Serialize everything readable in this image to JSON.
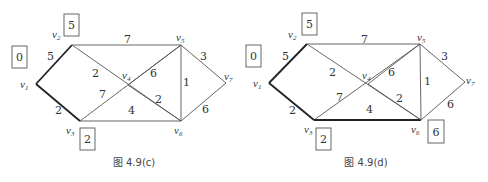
{
  "figures": [
    {
      "caption": "图 4.9(c)",
      "nodes": [
        {
          "id": "v1",
          "name": "v",
          "sub": "1",
          "x": 36,
          "y": 84,
          "lx": 20,
          "ly": 88
        },
        {
          "id": "v2",
          "name": "v",
          "sub": "2",
          "x": 72,
          "y": 45,
          "lx": 52,
          "ly": 38
        },
        {
          "id": "v3",
          "name": "v",
          "sub": "3",
          "x": 80,
          "y": 121,
          "lx": 66,
          "ly": 134
        },
        {
          "id": "v4",
          "name": "v",
          "sub": "4",
          "x": 128,
          "y": 85,
          "lx": 122,
          "ly": 79
        },
        {
          "id": "v5",
          "name": "v",
          "sub": "5",
          "x": 181,
          "y": 45,
          "lx": 176,
          "ly": 41
        },
        {
          "id": "v6",
          "name": "v",
          "sub": "6",
          "x": 181,
          "y": 121,
          "lx": 174,
          "ly": 134
        },
        {
          "id": "v7",
          "name": "v",
          "sub": "7",
          "x": 226,
          "y": 83,
          "lx": 224,
          "ly": 80
        }
      ],
      "edges": [
        {
          "from": "v1",
          "to": "v2",
          "w": "5",
          "lx": 47,
          "ly": 60,
          "bold": true
        },
        {
          "from": "v1",
          "to": "v3",
          "w": "2",
          "lx": 55,
          "ly": 114,
          "bold": true
        },
        {
          "from": "v2",
          "to": "v5",
          "w": "7",
          "lx": 124,
          "ly": 43,
          "bold": false
        },
        {
          "from": "v2",
          "to": "v6",
          "w": "2",
          "lx": 92,
          "ly": 77,
          "bold": false
        },
        {
          "from": "v3",
          "to": "v5",
          "w": "7",
          "lx": 99,
          "ly": 98,
          "bold": false
        },
        {
          "from": "v3",
          "to": "v6",
          "w": "4",
          "lx": 128,
          "ly": 114,
          "bold": false
        },
        {
          "from": "v5",
          "to": "v6",
          "w": "1",
          "lx": 183,
          "ly": 86,
          "bold": false
        },
        {
          "from": "v5",
          "to": "v7",
          "w": "3",
          "lx": 200,
          "ly": 60,
          "bold": false
        },
        {
          "from": "v6",
          "to": "v7",
          "w": "6",
          "lx": 202,
          "ly": 113,
          "bold": false
        },
        {
          "from": "v4",
          "to": "v5",
          "w": "6",
          "lx": 150,
          "ly": 77,
          "bold": false
        },
        {
          "from": "v4",
          "to": "v6",
          "w": "2",
          "lx": 155,
          "ly": 103,
          "bold": false
        }
      ],
      "boxes": [
        {
          "value": "0",
          "x": 12,
          "y": 46,
          "w": 15,
          "h": 22
        },
        {
          "value": "5",
          "x": 64,
          "y": 14,
          "w": 15,
          "h": 22
        },
        {
          "value": "2",
          "x": 80,
          "y": 128,
          "w": 15,
          "h": 22
        }
      ],
      "caption_x": 134,
      "caption_y": 166
    },
    {
      "caption": "图 4.9(d)",
      "nodes": [
        {
          "id": "v1",
          "name": "v",
          "sub": "1",
          "x": 269,
          "y": 83,
          "lx": 253,
          "ly": 87
        },
        {
          "id": "v2",
          "name": "v",
          "sub": "2",
          "x": 307,
          "y": 44,
          "lx": 288,
          "ly": 38
        },
        {
          "id": "v3",
          "name": "v",
          "sub": "3",
          "x": 314,
          "y": 120,
          "lx": 304,
          "ly": 133
        },
        {
          "id": "v4",
          "name": "v",
          "sub": "4",
          "x": 368,
          "y": 84,
          "lx": 362,
          "ly": 79
        },
        {
          "id": "v5",
          "name": "v",
          "sub": "5",
          "x": 420,
          "y": 44,
          "lx": 417,
          "ly": 41
        },
        {
          "id": "v6",
          "name": "v",
          "sub": "6",
          "x": 421,
          "y": 120,
          "lx": 411,
          "ly": 133
        },
        {
          "id": "v7",
          "name": "v",
          "sub": "7",
          "x": 465,
          "y": 82,
          "lx": 466,
          "ly": 84
        }
      ],
      "edges": [
        {
          "from": "v1",
          "to": "v2",
          "w": "5",
          "lx": 282,
          "ly": 60,
          "bold": true
        },
        {
          "from": "v1",
          "to": "v3",
          "w": "2",
          "lx": 289,
          "ly": 114,
          "bold": true
        },
        {
          "from": "v2",
          "to": "v5",
          "w": "7",
          "lx": 361,
          "ly": 43,
          "bold": false
        },
        {
          "from": "v2",
          "to": "v6",
          "w": "2",
          "lx": 329,
          "ly": 76,
          "bold": false
        },
        {
          "from": "v3",
          "to": "v5",
          "w": "7",
          "lx": 336,
          "ly": 101,
          "bold": false
        },
        {
          "from": "v3",
          "to": "v6",
          "w": "4",
          "lx": 366,
          "ly": 113,
          "bold": true
        },
        {
          "from": "v5",
          "to": "v6",
          "w": "1",
          "lx": 424,
          "ly": 85,
          "bold": false
        },
        {
          "from": "v5",
          "to": "v7",
          "w": "3",
          "lx": 441,
          "ly": 60,
          "bold": false
        },
        {
          "from": "v6",
          "to": "v7",
          "w": "6",
          "lx": 447,
          "ly": 108,
          "bold": false
        },
        {
          "from": "v4",
          "to": "v5",
          "w": "6",
          "lx": 388,
          "ly": 76,
          "bold": false
        },
        {
          "from": "v4",
          "to": "v6",
          "w": "2",
          "lx": 396,
          "ly": 102,
          "bold": false
        }
      ],
      "boxes": [
        {
          "value": "0",
          "x": 246,
          "y": 45,
          "w": 15,
          "h": 22
        },
        {
          "value": "5",
          "x": 302,
          "y": 13,
          "w": 15,
          "h": 22
        },
        {
          "value": "2",
          "x": 316,
          "y": 128,
          "w": 15,
          "h": 22
        },
        {
          "value": "6",
          "x": 428,
          "y": 120,
          "w": 16,
          "h": 23
        }
      ],
      "caption_x": 366,
      "caption_y": 166
    }
  ]
}
